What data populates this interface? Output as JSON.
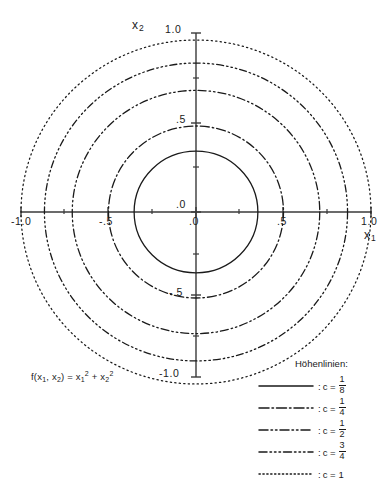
{
  "figure": {
    "kind": "contour-plot",
    "formula": {
      "fn": "f(x",
      "sub1": "1",
      "comma": ", x",
      "sub2": "2",
      "eq": ") = x",
      "sub3": "1",
      "sup3": "2",
      "plus": " + x",
      "sub4": "2",
      "sup4": "2",
      "full_text": "f(x1, x2) = x1² + x2²"
    },
    "line_color": "#1a1a1a",
    "axis_color": "#3a3a3a"
  },
  "axes": {
    "x": {
      "name": "x",
      "subscript": "1",
      "ticks": [
        "-1.0",
        "-.5",
        ".0",
        ".5",
        "1.0"
      ],
      "tick_values": [
        -1.0,
        -0.5,
        0.0,
        0.5,
        1.0
      ],
      "range": [
        -1.15,
        1.15
      ]
    },
    "y": {
      "name": "x",
      "subscript": "2",
      "ticks": [
        "1.0",
        ".5",
        ".0",
        "-.5",
        "-1.0"
      ],
      "tick_values": [
        1.0,
        0.5,
        0.0,
        -0.5,
        -1.0
      ],
      "range": [
        -1.15,
        1.15
      ]
    }
  },
  "legend": {
    "title": "Höhenlinien:",
    "entries": [
      {
        "style": "solid",
        "colon": ":",
        "ceq": "c =",
        "num": "1",
        "den": "8",
        "value_text": "1/8"
      },
      {
        "style": "dash-dot",
        "colon": ":",
        "ceq": "c =",
        "num": "1",
        "den": "4",
        "value_text": "1/4"
      },
      {
        "style": "dash-dot-dot",
        "colon": ":",
        "ceq": "c =",
        "num": "1",
        "den": "2",
        "value_text": "1/2"
      },
      {
        "style": "dash-dot-dot-dot",
        "colon": ":",
        "ceq": "c =",
        "num": "3",
        "den": "4",
        "value_text": "3/4"
      },
      {
        "style": "dotted",
        "colon": ":",
        "ceq": "c =",
        "whole": "1",
        "value_text": "1"
      }
    ]
  },
  "chart_data": {
    "type": "line",
    "title": "",
    "subtitle": "",
    "xlabel": "x1",
    "ylabel": "x2",
    "xlim": [
      -1.15,
      1.15
    ],
    "ylim": [
      -1.15,
      1.15
    ],
    "xticks": [
      -1.0,
      -0.5,
      0.0,
      0.5,
      1.0
    ],
    "yticks": [
      -1.0,
      -0.5,
      0.0,
      0.5,
      1.0
    ],
    "xticklabels": [
      "-1.0",
      "-.5",
      ".0",
      ".5",
      "1.0"
    ],
    "yticklabels": [
      "-1.0",
      "-.5",
      ".0",
      ".5",
      "1.0"
    ],
    "grid": false,
    "legend_position": "right-bottom",
    "function": "f(x1,x2) = x1^2 + x2^2",
    "contours": [
      {
        "name": "c = 1/8",
        "level": 0.125,
        "radius": 0.3536,
        "style": "solid",
        "dasharray": ""
      },
      {
        "name": "c = 1/4",
        "level": 0.25,
        "radius": 0.5,
        "style": "dash-dot",
        "dasharray": "9,3,1.5,3"
      },
      {
        "name": "c = 1/2",
        "level": 0.5,
        "radius": 0.7071,
        "style": "dash-dot-dot",
        "dasharray": "8,3,1.5,3,1.5,3"
      },
      {
        "name": "c = 3/4",
        "level": 0.75,
        "radius": 0.866,
        "style": "dash-dot-dot-dot",
        "dasharray": "7,3,1.5,3,1.5,3,1.5,3"
      },
      {
        "name": "c = 1",
        "level": 1.0,
        "radius": 1.0,
        "style": "dotted",
        "dasharray": "1.3,3.2"
      }
    ],
    "center": [
      0,
      0
    ]
  }
}
